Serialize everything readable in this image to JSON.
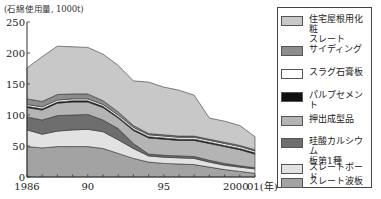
{
  "chart_data": {
    "type": "area",
    "stacked": true,
    "title": "",
    "ylabel": "(石綿使用量, 1000t)",
    "xlabel": "(年)",
    "ylim": [
      0,
      250
    ],
    "yticks": [
      0,
      50,
      100,
      150,
      200,
      250
    ],
    "xtick_labels": [
      {
        "x": 1986,
        "label": "1986"
      },
      {
        "x": 1990,
        "label": "90"
      },
      {
        "x": 1995,
        "label": "95"
      },
      {
        "x": 2000,
        "label": "2000"
      },
      {
        "x": 2001,
        "label": "01(年)"
      }
    ],
    "x": [
      1986,
      1987,
      1988,
      1989,
      1990,
      1991,
      1992,
      1993,
      1994,
      1995,
      1996,
      1997,
      1998,
      1999,
      2000,
      2001
    ],
    "grid": false,
    "legend_position": "right",
    "series": [
      {
        "name": "スレート波板",
        "color": "#a3a3a3",
        "values": [
          49,
          47,
          49,
          49,
          49,
          46,
          38,
          30,
          24,
          22,
          21,
          20,
          16,
          12,
          9,
          6
        ]
      },
      {
        "name": "スレートボード",
        "color": "#e2e2e2",
        "values": [
          27,
          22,
          25,
          27,
          28,
          27,
          22,
          16,
          10,
          10,
          10,
          10,
          8,
          7,
          7,
          7
        ]
      },
      {
        "name": "珪酸カルシウム板第1種",
        "color": "#6e6e6e",
        "values": [
          21,
          23,
          25,
          24,
          24,
          19,
          18,
          8,
          3,
          3,
          3,
          3,
          3,
          3,
          2,
          2
        ]
      },
      {
        "name": "押出成型品",
        "color": "#b4b4b4",
        "values": [
          15,
          16,
          20,
          21,
          20,
          20,
          17,
          21,
          26,
          26,
          25,
          26,
          27,
          27,
          26,
          22
        ]
      },
      {
        "name": "パルプセメント",
        "color": "#111111",
        "values": [
          2,
          2,
          2,
          2,
          2,
          2,
          2,
          2,
          2,
          2,
          2,
          2,
          2,
          2,
          2,
          2
        ]
      },
      {
        "name": "スラグ石膏板",
        "color": "#ffffff",
        "values": [
          3,
          3,
          3,
          3,
          3,
          3,
          3,
          3,
          3,
          3,
          3,
          3,
          3,
          3,
          3,
          3
        ]
      },
      {
        "name": "サイディング",
        "color": "#8c8c8c",
        "values": [
          9,
          9,
          9,
          8,
          8,
          6,
          5,
          3,
          2,
          2,
          2,
          2,
          2,
          2,
          2,
          2
        ]
      },
      {
        "name": "住宅屋根用化粧スレート",
        "color": "#c8c8c8",
        "values": [
          50,
          72,
          78,
          76,
          75,
          75,
          75,
          72,
          83,
          77,
          74,
          66,
          34,
          34,
          32,
          21
        ]
      }
    ],
    "totals": [
      176,
      194,
      211,
      210,
      209,
      198,
      180,
      155,
      153,
      145,
      140,
      132,
      95,
      90,
      83,
      65
    ]
  },
  "page": {
    "unit_label": "(石綿使用量, 1000t)"
  },
  "legend": {
    "items": [
      {
        "label": "住宅屋根用化粧\nスレート",
        "color": "#c8c8c8"
      },
      {
        "label": "サイディング",
        "color": "#8c8c8c"
      },
      {
        "label": "スラグ石膏板",
        "color": "#ffffff"
      },
      {
        "label": "パルプセメント",
        "color": "#111111"
      },
      {
        "label": "押出成型品",
        "color": "#b4b4b4"
      },
      {
        "label": "珪酸カルシウム\n板第1種",
        "color": "#6e6e6e"
      },
      {
        "label": "スレートボード",
        "color": "#e2e2e2"
      },
      {
        "label": "スレート波板",
        "color": "#a3a3a3"
      }
    ]
  }
}
